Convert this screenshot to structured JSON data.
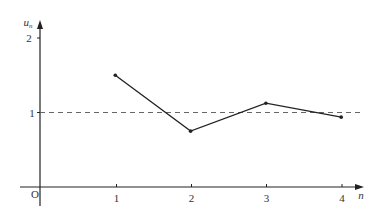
{
  "chart_data": {
    "type": "line",
    "title": "",
    "xlabel": "n",
    "ylabel": "u_n",
    "ylabel_main": "u",
    "ylabel_sub": "n",
    "origin_label": "O",
    "x": [
      1,
      2,
      3,
      4
    ],
    "series": [
      {
        "name": "u_n",
        "values": [
          1.5,
          0.75,
          1.125,
          0.9375
        ]
      }
    ],
    "x_ticks": [
      "1",
      "2",
      "3",
      "4"
    ],
    "y_ticks": [
      "1",
      "2"
    ],
    "reference_line": {
      "y": 1,
      "style": "dashed"
    },
    "xlim": [
      0,
      4.3
    ],
    "ylim": [
      0,
      2.2
    ],
    "grid": false,
    "legend": "none",
    "colors": {
      "line": "#222222",
      "axis": "#222222",
      "dashed": "#555555"
    }
  }
}
